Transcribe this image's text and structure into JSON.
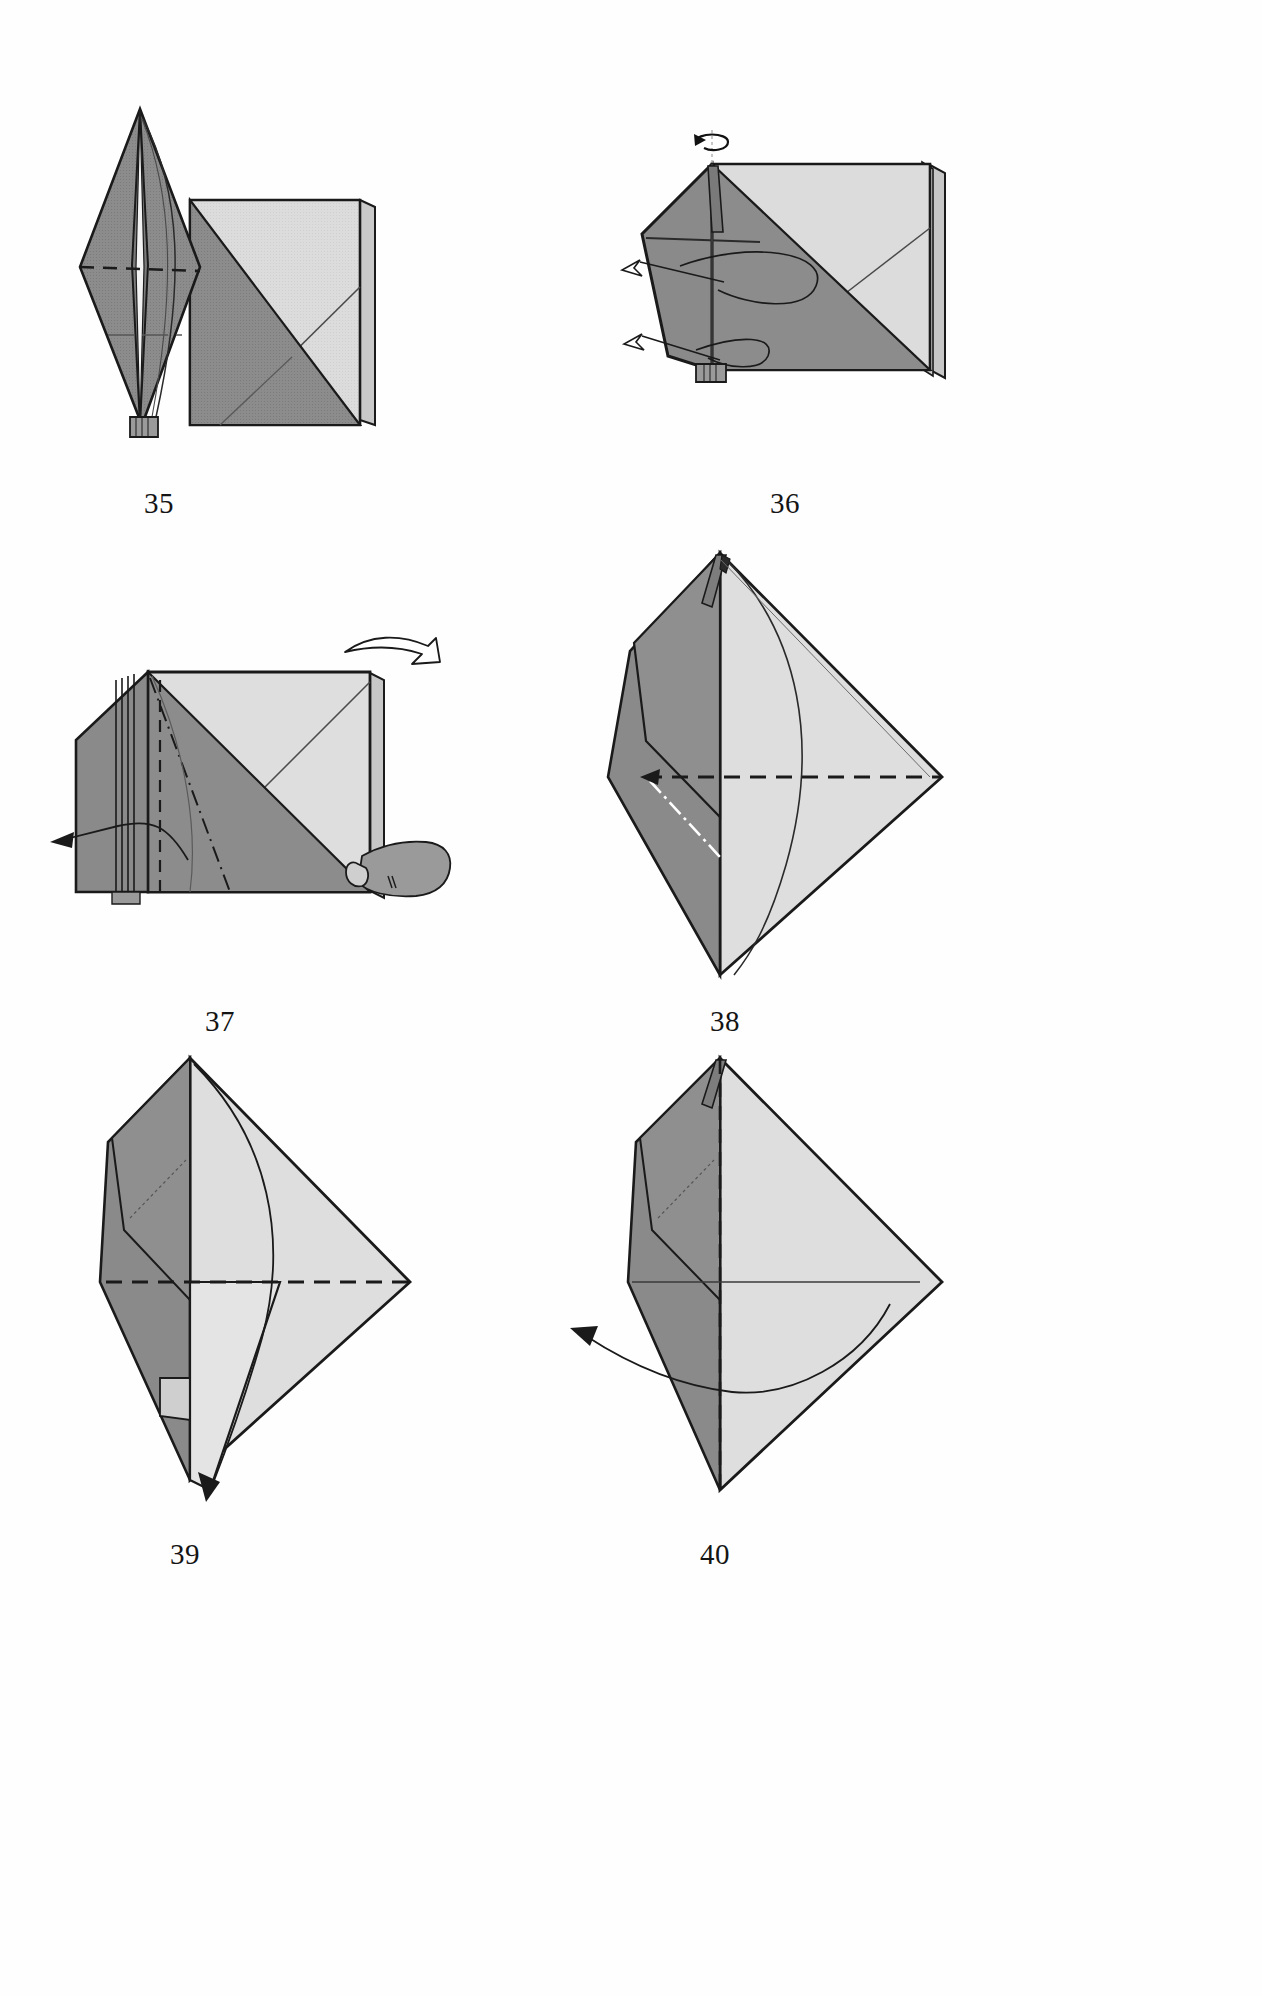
{
  "page": {
    "width": 1262,
    "height": 1996,
    "background": "#fefefe"
  },
  "palette": {
    "paper_front": "#8c8c8c",
    "paper_front_dark": "#7e7e7e",
    "paper_back": "#d8d8d8",
    "paper_back_light": "#e2e2e2",
    "outline": "#1a1a1a",
    "crease_line": "#3a3a3a",
    "white_crease": "#ffffff",
    "arrow_fill": "#ffffff",
    "hand_fill": "#9a9a9a",
    "caption_color": "#141414"
  },
  "figures": [
    {
      "id": "fig-35",
      "number": "35",
      "caption": "35",
      "caption_x": 119,
      "caption_y": 487,
      "description": "Narrow upright kite point on the left with layered spine, joined to a large square flap on the right; horizontal valley-fold dashed line crosses the left point.",
      "annotations": [
        "dashed-valley-fold",
        "layer-edges",
        "curved-fold-line"
      ]
    },
    {
      "id": "fig-36",
      "number": "36",
      "caption": "36",
      "caption_x": 745,
      "caption_y": 487,
      "description": "Same model rotated; a rotate-arrow sits above the top point and two hollow pull-out arrows point to the lower left.",
      "annotations": [
        "rotate-arrow",
        "hollow-arrow-upper",
        "hollow-arrow-lower",
        "pull-loop-curves"
      ]
    },
    {
      "id": "fig-37",
      "number": "37",
      "caption": "37",
      "caption_x": 180,
      "caption_y": 1005,
      "description": "Square model lying with layered left edge; hollow push arrow above the top right corner, a hand grips the right edge, and a solid arrow pulls a flap out to the left.",
      "annotations": [
        "hollow-push-arrow",
        "hand-holding-edge",
        "pull-arrow-left",
        "dashed-valley-fold",
        "dash-dot-mountain-fold"
      ]
    },
    {
      "id": "fig-38",
      "number": "38",
      "caption": "38",
      "caption_x": 685,
      "caption_y": 1005,
      "description": "Tall diamond shape with a horizontal dashed valley fold across the middle and a white dash-dot mountain fold on the lower left; a long curved fold line sweeps down the right half.",
      "annotations": [
        "dashed-valley-fold",
        "white-dash-dot-mountain-fold",
        "curved-fold-line"
      ]
    },
    {
      "id": "fig-39",
      "number": "39",
      "caption": "39",
      "caption_x": 145,
      "caption_y": 1538,
      "description": "Diamond shape with a horizontal dashed valley fold and a long curved arrow sweeping down to a point at the bottom left.",
      "annotations": [
        "dashed-valley-fold",
        "curved-arrow-down"
      ]
    },
    {
      "id": "fig-40",
      "number": "40",
      "caption": "40",
      "caption_x": 675,
      "caption_y": 1538,
      "description": "Diamond shape with a vertical dashed fold down the centre and a curved arrow sweeping out to the upper left.",
      "annotations": [
        "vertical-dashed-fold",
        "curved-arrow-left"
      ]
    }
  ]
}
